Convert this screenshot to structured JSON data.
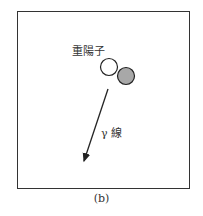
{
  "diagram": {
    "particle_label": "重陽子",
    "ray_label": "γ 線",
    "caption": "(b)",
    "colors": {
      "frame": "#333333",
      "proton_fill": "#ffffff",
      "neutron_fill": "#a8a8a8",
      "stroke": "#222222"
    }
  }
}
